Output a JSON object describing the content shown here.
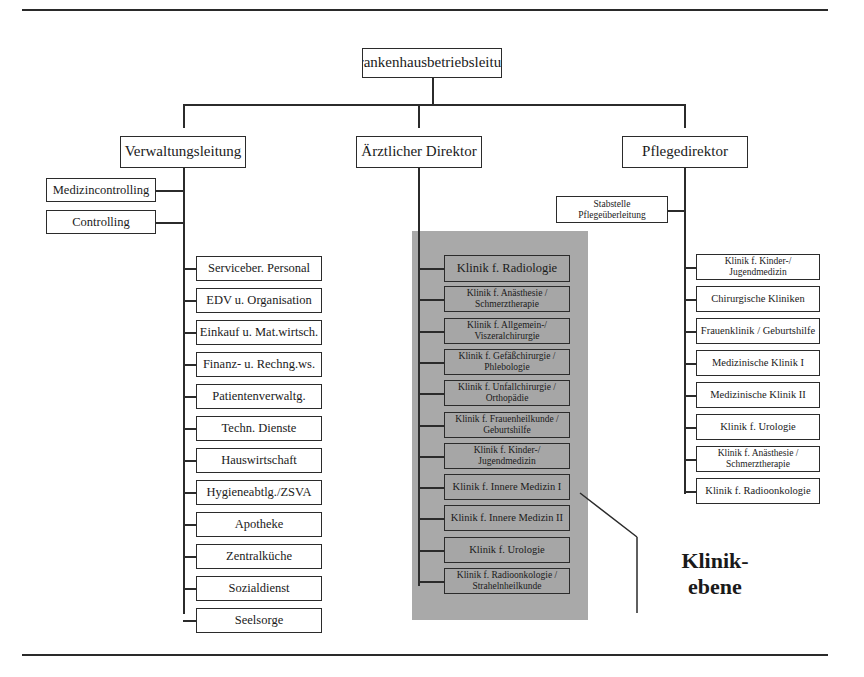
{
  "top": {
    "title": "Krankenhausbetriebsleitung"
  },
  "directors": {
    "admin": "Verwaltungsleitung",
    "medical": "Ärztlicher Direktor",
    "nursing": "Pflegedirektor"
  },
  "admin_staff": [
    "Medizincontrolling",
    "Controlling"
  ],
  "admin_departments": [
    "Serviceber. Personal",
    "EDV u. Organisation",
    "Einkauf u. Mat.wirtsch.",
    "Finanz- u. Rechng.ws.",
    "Patientenverwaltg.",
    "Techn. Dienste",
    "Hauswirtschaft",
    "Hygieneabtlg./ZSVA",
    "Apotheke",
    "Zentralküche",
    "Sozialdienst",
    "Seelsorge"
  ],
  "clinics": [
    {
      "l1": "Klinik f. Radiologie",
      "l2": ""
    },
    {
      "l1": "Klinik f. Anästhesie /",
      "l2": "Schmerztherapie"
    },
    {
      "l1": "Klinik f. Allgemein-/",
      "l2": "Viszeralchirurgie"
    },
    {
      "l1": "Klinik f. Gefäßchirurgie /",
      "l2": "Phlebologie"
    },
    {
      "l1": "Klinik f. Unfallchirurgie /",
      "l2": "Orthopädie"
    },
    {
      "l1": "Klinik f. Frauenheilkunde /",
      "l2": "Geburtshilfe"
    },
    {
      "l1": "Klinik f. Kinder-/",
      "l2": "Jugendmedizin"
    },
    {
      "l1": "Klinik f. Innere Medizin I",
      "l2": ""
    },
    {
      "l1": "Klinik f. Innere Medizin II",
      "l2": ""
    },
    {
      "l1": "Klinik f. Urologie",
      "l2": ""
    },
    {
      "l1": "Klinik f. Radioonkologie /",
      "l2": "Strahelnheilkunde"
    }
  ],
  "nursing_staff": {
    "l1": "Stabstelle",
    "l2": "Pflegeüberleitung"
  },
  "nursing_units": [
    {
      "l1": "Klinik f. Kinder-/",
      "l2": "Jugendmedizin"
    },
    {
      "l1": "Chirurgische Kliniken",
      "l2": ""
    },
    {
      "l1": "Frauenklinik / Geburtshilfe",
      "l2": ""
    },
    {
      "l1": "Medizinische Klinik I",
      "l2": ""
    },
    {
      "l1": "Medizinische Klinik II",
      "l2": ""
    },
    {
      "l1": "Klinik f. Urologie",
      "l2": ""
    },
    {
      "l1": "Klinik f. Anästhesie /",
      "l2": "Schmerztherapie"
    },
    {
      "l1": "Klinik f. Radioonkologie",
      "l2": ""
    }
  ],
  "callout": {
    "line1": "Klinik-",
    "line2": "ebene"
  },
  "colors": {
    "shade": "#a9a9a9",
    "line": "#2b2b2b",
    "background": "#ffffff"
  }
}
